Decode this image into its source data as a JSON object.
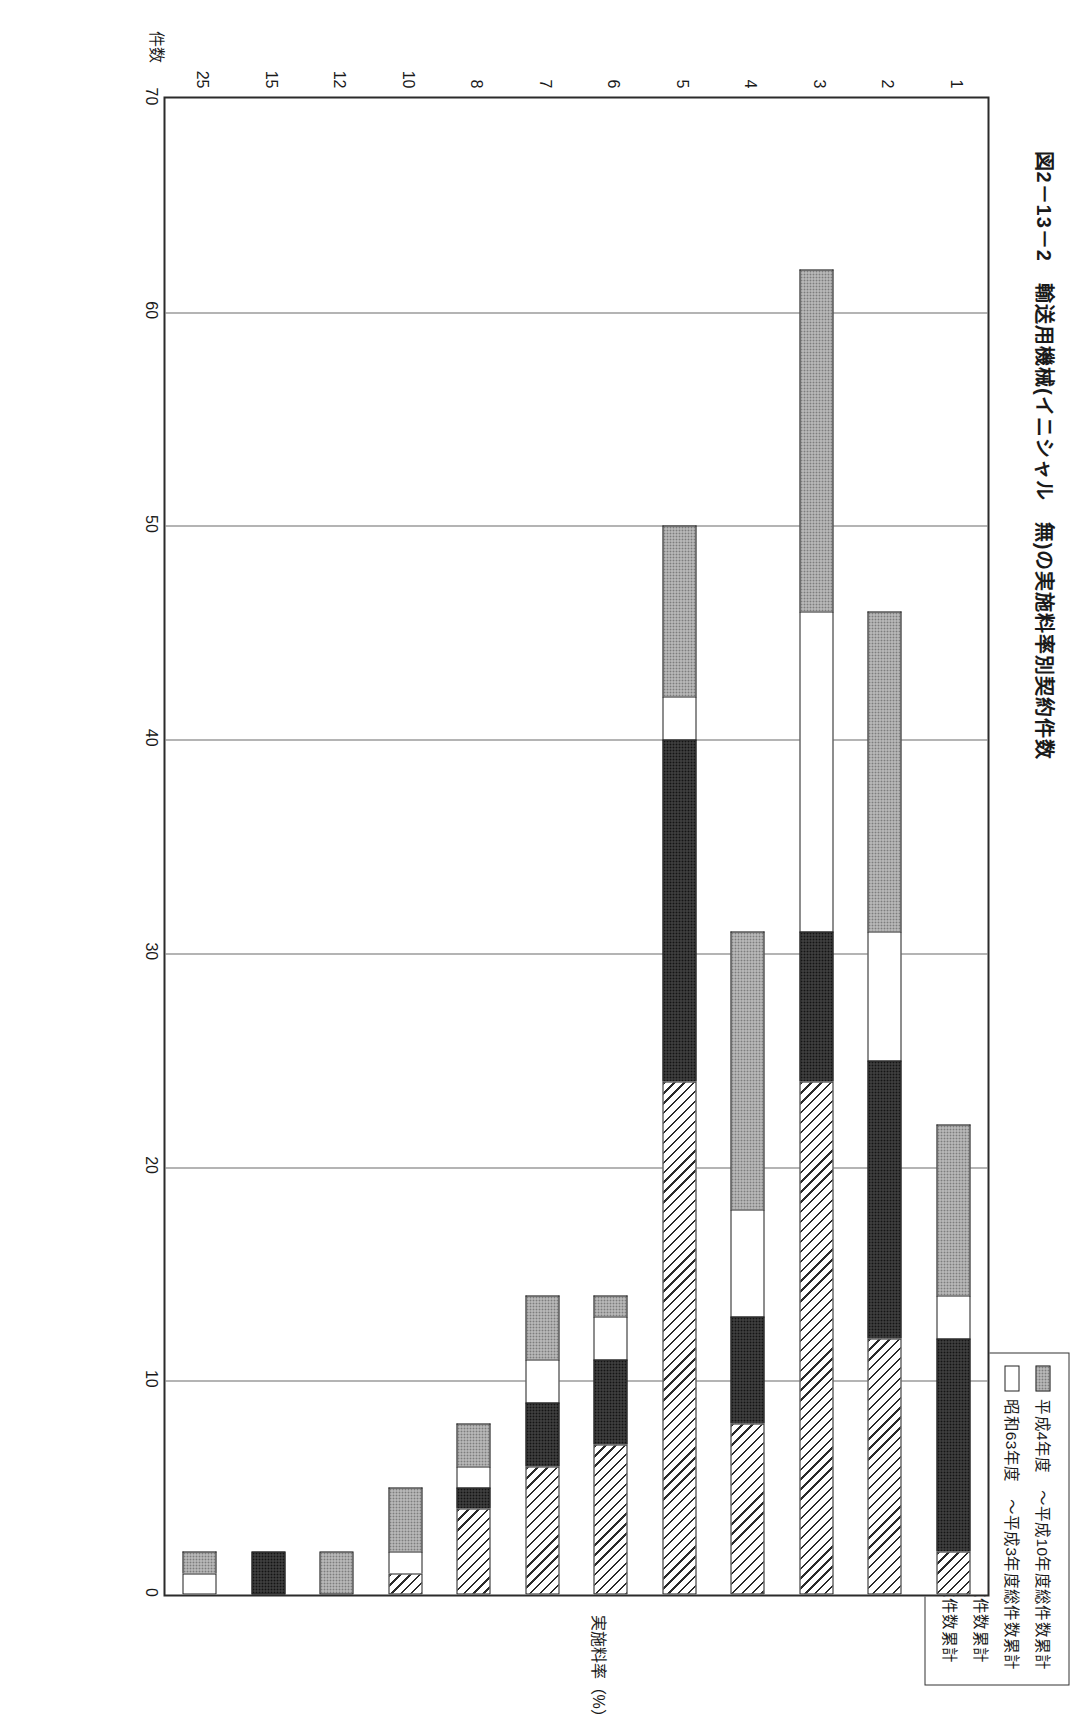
{
  "figure": {
    "title": "図2－13－2　輸送用機械(イニシャル　無)の実施料率別契約件数"
  },
  "legend": {
    "items": [
      {
        "label": "平成4年度　～平成10年度総件数累計",
        "pattern": "light-stipple",
        "color": "#c9c9c9"
      },
      {
        "label": "昭和63年度　～平成3年度総件数累計",
        "pattern": "white",
        "color": "#ffffff"
      },
      {
        "label": "昭和49年　～昭和52年　総件数累計",
        "pattern": "dark-stipple",
        "color": "#4a4a4a"
      },
      {
        "label": "昭和43年　～昭和48年　総件数累計",
        "pattern": "diagonal-hatch",
        "color": "#ffffff"
      }
    ]
  },
  "axes": {
    "value_axis_title": "件数",
    "category_axis_title": "実施料率（%）",
    "value_ticks": [
      "0",
      "10",
      "20",
      "30",
      "40",
      "50",
      "60",
      "70"
    ],
    "category_ticks": [
      "1",
      "2",
      "3",
      "4",
      "5",
      "6",
      "7",
      "8",
      "10",
      "12",
      "15",
      "25"
    ]
  },
  "chart_data": {
    "type": "bar",
    "orientation": "horizontal",
    "stacked": true,
    "title": "図2－13－2　輸送用機械(イニシャル　無)の実施料率別契約件数",
    "xlabel": "件数",
    "ylabel": "実施料率（%）",
    "xlim": [
      0,
      70
    ],
    "grid": true,
    "legend_position": "top-left",
    "categories": [
      "1",
      "2",
      "3",
      "4",
      "5",
      "6",
      "7",
      "8",
      "10",
      "12",
      "15",
      "25"
    ],
    "series": [
      {
        "name": "昭和43年　～昭和48年　総件数累計",
        "pattern": "diagonal-hatch",
        "values": [
          2,
          12,
          24,
          8,
          24,
          7,
          6,
          4,
          1,
          0,
          0,
          0
        ]
      },
      {
        "name": "昭和49年　～昭和52年　総件数累計",
        "pattern": "dark-stipple",
        "values": [
          10,
          13,
          7,
          5,
          16,
          4,
          3,
          1,
          0,
          0,
          2,
          0
        ]
      },
      {
        "name": "昭和63年度　～平成3年度総件数累計",
        "pattern": "white",
        "values": [
          2,
          6,
          15,
          5,
          2,
          2,
          2,
          1,
          1,
          0,
          0,
          1
        ]
      },
      {
        "name": "平成4年度　～平成10年度総件数累計",
        "pattern": "light-stipple",
        "values": [
          8,
          15,
          16,
          13,
          8,
          1,
          3,
          2,
          3,
          2,
          0,
          1
        ]
      }
    ],
    "totals": [
      22,
      46,
      62,
      31,
      50,
      14,
      14,
      8,
      5,
      2,
      2,
      2
    ]
  }
}
